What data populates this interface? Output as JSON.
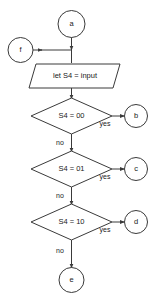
{
  "diagram": {
    "colors": {
      "stroke": "#3a3a3a",
      "fill": "#ffffff",
      "text": "#1a1a1a",
      "background": "#ffffff"
    },
    "nodes": {
      "entry_a": {
        "label": "a",
        "shape": "circle"
      },
      "entry_f": {
        "label": "f",
        "shape": "circle"
      },
      "process_input": {
        "label": "let S4 = input",
        "shape": "parallelogram"
      },
      "decision_00": {
        "label": "S4 = 00",
        "shape": "diamond"
      },
      "decision_01": {
        "label": "S4 = 01",
        "shape": "diamond"
      },
      "decision_10": {
        "label": "S4 = 10",
        "shape": "diamond"
      },
      "exit_b": {
        "label": "b",
        "shape": "circle"
      },
      "exit_c": {
        "label": "c",
        "shape": "circle"
      },
      "exit_d": {
        "label": "d",
        "shape": "circle"
      },
      "exit_e": {
        "label": "e",
        "shape": "circle"
      }
    },
    "edge_labels": {
      "yes_00": "yes",
      "no_00": "no",
      "yes_01": "yes",
      "no_01": "no",
      "yes_10": "yes",
      "no_10": "no"
    }
  }
}
